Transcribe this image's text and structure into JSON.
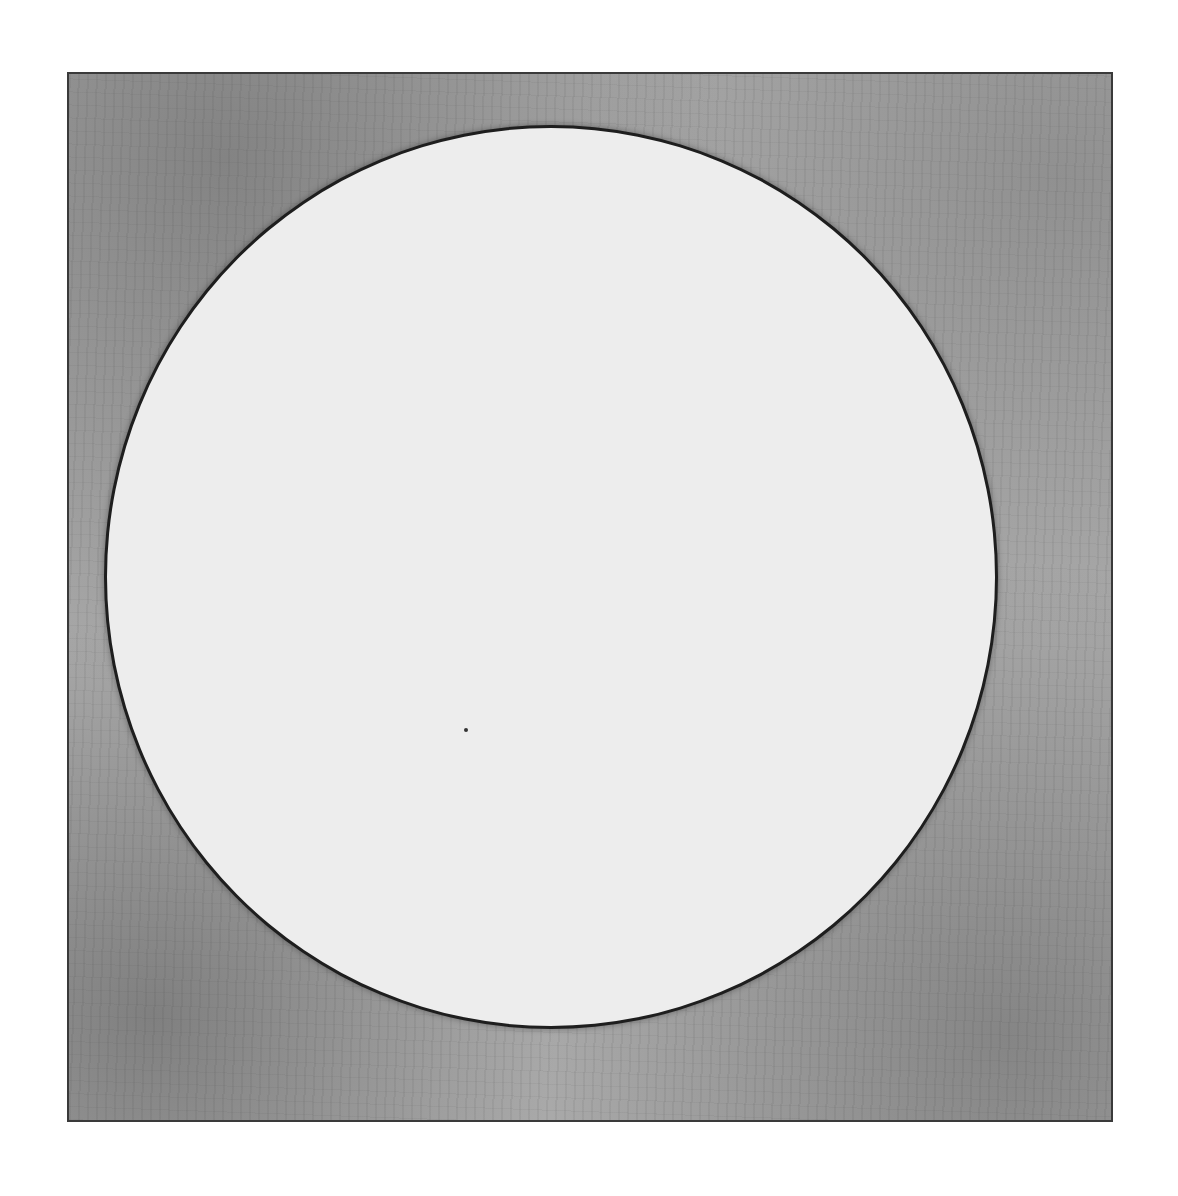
{
  "artwork": {
    "description": "Monochrome print: white circle on textured gray square plate",
    "colors": {
      "background": "#ffffff",
      "plate": "#a9a9a9",
      "circle": "#ededed",
      "outline": "#1e1e1e"
    }
  }
}
